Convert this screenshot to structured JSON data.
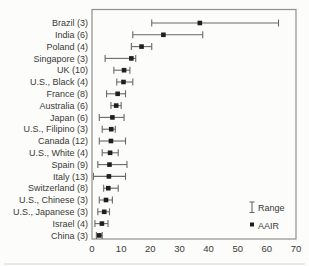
{
  "figure": {
    "background": "#fcfcfa",
    "frame_color": "#8f8f8c",
    "line_color": "#696966",
    "marker_color": "#1f1f1d",
    "text_color": "#3a3a38",
    "scan_artifact_color": "#d8d8d6"
  },
  "legend": {
    "range_label": "Range",
    "range_icon": "error-bar-icon",
    "aair_label": "AAIR",
    "aair_icon": "filled-square-icon"
  },
  "chart_data": {
    "type": "scatter",
    "subtype": "horizontal-dot-plot-with-range-bars",
    "title": "",
    "xlabel": "",
    "ylabel": "",
    "xlim": [
      0,
      70
    ],
    "x_ticks": [
      0,
      10,
      20,
      30,
      40,
      50,
      60,
      70
    ],
    "grid": false,
    "legend_position": "inside-bottom-right",
    "categories": [
      "Brazil (3)",
      "India (6)",
      "Poland (4)",
      "Singapore (3)",
      "UK (10)",
      "U.S., Black (4)",
      "France (8)",
      "Australia (6)",
      "Japan (6)",
      "U.S., Filipino (3)",
      "Canada (12)",
      "U.S., White (4)",
      "Spain (9)",
      "Italy (13)",
      "Switzerland (8)",
      "U.S., Chinese (3)",
      "U.S., Japanese (3)",
      "Israel (4)",
      "China (3)"
    ],
    "series": [
      {
        "name": "AAIR",
        "marker": "filled-square",
        "values": [
          37,
          24.5,
          17,
          13.5,
          11,
          10.8,
          8.8,
          8.3,
          7,
          6.6,
          6.5,
          6.2,
          6,
          5.8,
          5.6,
          4.8,
          4.2,
          3.4,
          2.5
        ]
      },
      {
        "name": "Range min",
        "marker": "error-bar-cap",
        "values": [
          20.5,
          14,
          13.5,
          4.5,
          7.5,
          8.5,
          5,
          6.5,
          2.5,
          3.5,
          2.5,
          3.5,
          2,
          0.5,
          4,
          2.5,
          2,
          1,
          1.5
        ]
      },
      {
        "name": "Range max",
        "marker": "error-bar-cap",
        "values": [
          64,
          38,
          20.5,
          15,
          13,
          14,
          11.5,
          10,
          11,
          8,
          11.5,
          9,
          12,
          11.5,
          9,
          7,
          6,
          5.5,
          3.5
        ]
      }
    ]
  }
}
